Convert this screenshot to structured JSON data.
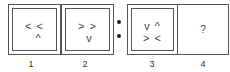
{
  "puzzle": {
    "panels": [
      {
        "number": "1",
        "row1": "< <",
        "row2": "  ^"
      },
      {
        "number": "2",
        "row1": "> >",
        "row2": " v"
      },
      {
        "number": "3",
        "row1": "v ^",
        "row2": "> <"
      },
      {
        "number": "4",
        "placeholder": "?"
      }
    ],
    "separator_icon": "colon-dots"
  }
}
